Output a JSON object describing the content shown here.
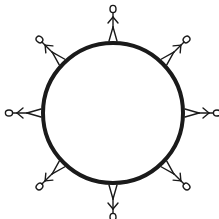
{
  "diagram": {
    "globe": {
      "cx": 113,
      "cy": 113,
      "r": 70,
      "stroke": "#1a1a1a",
      "stroke_width": 4
    },
    "figures": [
      {
        "angle": 0
      },
      {
        "angle": 45
      },
      {
        "angle": 90
      },
      {
        "angle": 135
      },
      {
        "angle": 180
      },
      {
        "angle": 225
      },
      {
        "angle": 270
      },
      {
        "angle": 315
      }
    ],
    "figure_count": 8,
    "colors": {
      "ink": "#1a1a1a",
      "background": "#ffffff"
    }
  }
}
